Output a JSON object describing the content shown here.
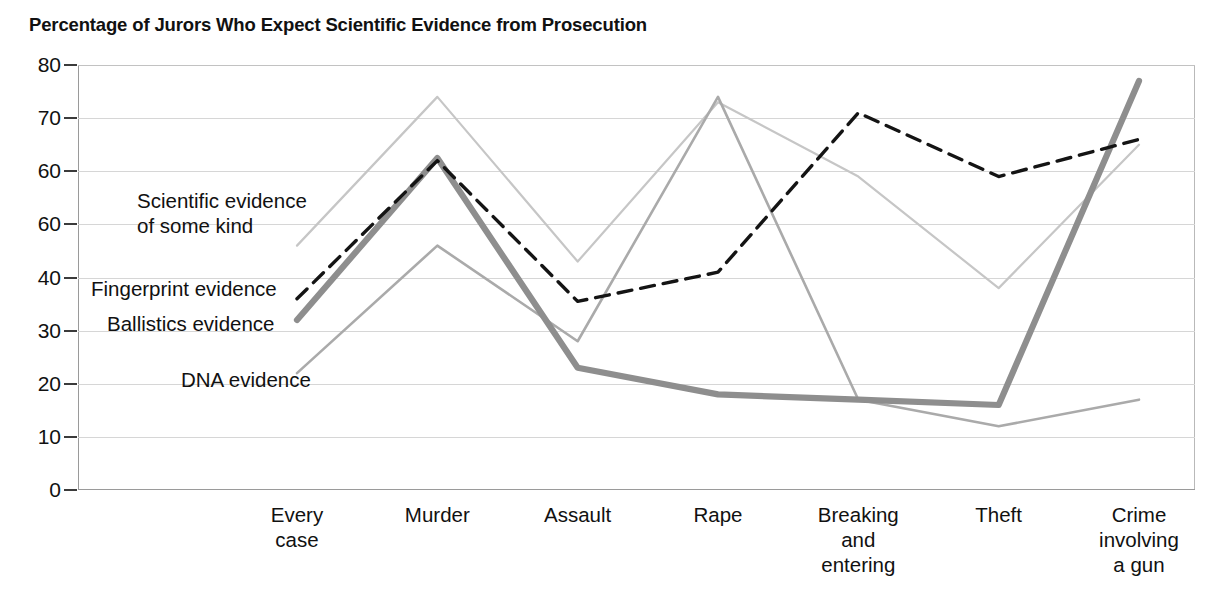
{
  "chart_data": {
    "type": "line",
    "title": "Percentage of Jurors Who Expect Scientific Evidence from Prosecution",
    "xlabel": "",
    "ylabel": "",
    "ylim": [
      0,
      80
    ],
    "ytick_step": 10,
    "grid": true,
    "legend_position": "inline-annotations-left",
    "ytick_labels": [
      "80",
      "70",
      "60",
      "60",
      "40",
      "30",
      "20",
      "10",
      "0"
    ],
    "ytick_values": [
      80,
      70,
      60,
      50,
      40,
      30,
      20,
      10,
      0
    ],
    "ytick_note": "The tick at the 50 position is printed as \"60\" in the source image",
    "categories": [
      "Every case",
      "Murder",
      "Assault",
      "Rape",
      "Breaking and entering",
      "Theft",
      "Crime involving a gun"
    ],
    "category_label_lines": [
      [
        "Every",
        "case"
      ],
      [
        "Murder"
      ],
      [
        "Assault"
      ],
      [
        "Rape"
      ],
      [
        "Breaking",
        "and",
        "entering"
      ],
      [
        "Theft"
      ],
      [
        "Crime",
        "involving",
        "a gun"
      ]
    ],
    "series": [
      {
        "name": "Scientific evidence of some kind",
        "label_lines": [
          "Scientific evidence",
          "of some kind"
        ],
        "style": "thin-light-gray",
        "color": "#c6c6c6",
        "width": 2.2,
        "dash": "none",
        "values": [
          46,
          74,
          43,
          73,
          59,
          38,
          65
        ]
      },
      {
        "name": "Fingerprint evidence",
        "label_lines": [
          "Fingerprint evidence"
        ],
        "style": "black-dashed",
        "color": "#141414",
        "width": 3.4,
        "dash": "14,9",
        "values": [
          36,
          62,
          35.5,
          41,
          71,
          59,
          66
        ]
      },
      {
        "name": "Ballistics evidence",
        "label_lines": [
          "Ballistics evidence"
        ],
        "style": "thick-medium-gray",
        "color": "#8e8e8e",
        "width": 6.2,
        "dash": "none",
        "values": [
          32,
          62.5,
          23,
          18,
          17,
          16,
          77
        ]
      },
      {
        "name": "DNA evidence",
        "label_lines": [
          "DNA evidence"
        ],
        "style": "thin-medium-gray",
        "color": "#aaaaaa",
        "width": 2.6,
        "dash": "none",
        "values": [
          22,
          46,
          28,
          74,
          17,
          12,
          17
        ]
      }
    ]
  }
}
